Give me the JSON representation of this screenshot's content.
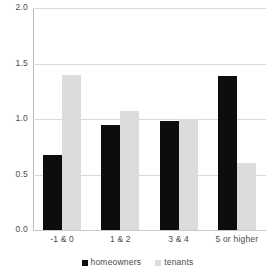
{
  "chart_data": {
    "type": "bar",
    "title": "",
    "xlabel": "",
    "ylabel": "",
    "categories": [
      "-1 & 0",
      "1 & 2",
      "3 & 4",
      "5 or higher"
    ],
    "series": [
      {
        "name": "homeowners",
        "color": "#0d0d0d",
        "values": [
          0.68,
          0.95,
          0.98,
          1.39
        ]
      },
      {
        "name": "tenants",
        "color": "#dcdcdc",
        "values": [
          1.4,
          1.07,
          1.0,
          0.6
        ]
      }
    ],
    "ylim": [
      0.0,
      2.0
    ],
    "yticks": [
      0.0,
      0.5,
      1.0,
      1.5,
      2.0
    ],
    "ytick_labels": [
      "0.0",
      "0.5",
      "1.0",
      "1.5",
      "2.0"
    ],
    "grid": true,
    "legend_position": "bottom"
  },
  "legend": {
    "items": [
      {
        "label": "homeowners"
      },
      {
        "label": "tenants"
      }
    ]
  },
  "colors": {
    "homeowners": "#0d0d0d",
    "tenants": "#dcdcdc",
    "gridline": "#d9d9d9",
    "axis": "#bdbdbd",
    "text": "#4a4a4a",
    "background": "#ffffff"
  }
}
